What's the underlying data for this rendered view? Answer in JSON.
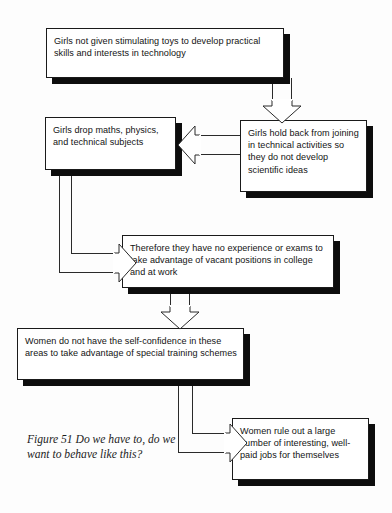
{
  "figure": {
    "caption_label": "Figure 51",
    "caption_text": "Do we have to, do we want to behave like this?",
    "caption_full": "Figure 51  Do we have to, do we want to behave like this?",
    "ink_color": "#131313",
    "shadow_color": "#0d0d0d",
    "background_color": "#fdfdfd"
  },
  "nodes": [
    {
      "id": "toys",
      "text": "Girls not given stimulating toys to develop practical skills and interests in technology"
    },
    {
      "id": "drop-subjects",
      "text": "Girls drop maths, physics, and technical subjects"
    },
    {
      "id": "hold-back",
      "text": "Girls hold back from joining in technical activities so they do not develop scientific ideas"
    },
    {
      "id": "no-experience",
      "text": "Therefore they have no experience or exams to take advantage of vacant positions in college and at work"
    },
    {
      "id": "no-confidence",
      "text": "Women do not have the self-confidence in these areas to take advantage of special training schemes"
    },
    {
      "id": "rule-out-jobs",
      "text": "Women rule out a large number of interesting, well-paid jobs for themselves"
    }
  ],
  "edges": [
    {
      "id": "toys-to-holdback",
      "from": "toys",
      "to": "hold-back",
      "direction": "down"
    },
    {
      "id": "holdback-to-dropsubjects",
      "from": "hold-back",
      "to": "drop-subjects",
      "direction": "left"
    },
    {
      "id": "dropsubjects-to-noexp",
      "from": "drop-subjects",
      "to": "no-experience",
      "direction": "right"
    },
    {
      "id": "noexp-to-noconfidence",
      "from": "no-experience",
      "to": "no-confidence",
      "direction": "down"
    },
    {
      "id": "noconfidence-to-ruleout",
      "from": "no-confidence",
      "to": "rule-out-jobs",
      "direction": "right"
    }
  ]
}
